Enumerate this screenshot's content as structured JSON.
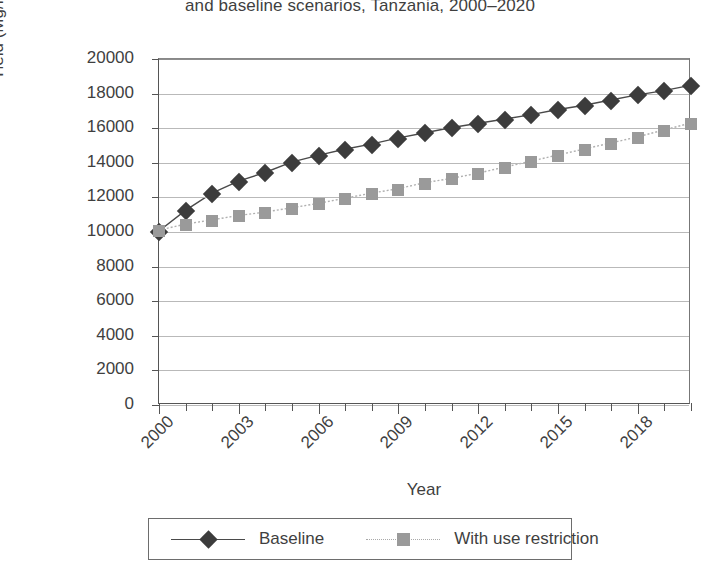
{
  "chart_data": {
    "type": "line",
    "title": "and baseline scenarios, Tanzania, 2000–2020",
    "xlabel": "Year",
    "ylabel": "Yield (Mg/ha)",
    "ylim": [
      0,
      20000
    ],
    "ytick_step": 2000,
    "yticks": [
      "0",
      "2000",
      "4000",
      "6000",
      "8000",
      "10000",
      "12000",
      "14000",
      "16000",
      "18000",
      "20000"
    ],
    "x": [
      2000,
      2001,
      2002,
      2003,
      2004,
      2005,
      2006,
      2007,
      2008,
      2009,
      2010,
      2011,
      2012,
      2013,
      2014,
      2015,
      2016,
      2017,
      2018,
      2019,
      2020
    ],
    "xtick_labels": [
      "2000",
      "2003",
      "2006",
      "2009",
      "2012",
      "2015",
      "2018"
    ],
    "xtick_years": [
      2000,
      2003,
      2006,
      2009,
      2012,
      2015,
      2018
    ],
    "grid": true,
    "legend_position": "bottom",
    "series": [
      {
        "name": "Baseline",
        "marker": "diamond",
        "color": "#3c3c3c",
        "line_style": "solid",
        "values": [
          10000,
          11200,
          12200,
          12900,
          13400,
          14000,
          14400,
          14750,
          15050,
          15400,
          15700,
          16000,
          16250,
          16500,
          16750,
          17050,
          17300,
          17600,
          17900,
          18150,
          18450
        ]
      },
      {
        "name": "With use restriction",
        "marker": "square",
        "color": "#9a9a9a",
        "line_style": "dotted",
        "values": [
          10050,
          10400,
          10650,
          10900,
          11100,
          11350,
          11600,
          11900,
          12200,
          12450,
          12800,
          13050,
          13350,
          13700,
          14050,
          14400,
          14750,
          15100,
          15450,
          15850,
          16250
        ]
      }
    ]
  },
  "legend": {
    "entries": [
      {
        "label": "Baseline"
      },
      {
        "label": "With use restriction"
      }
    ]
  }
}
